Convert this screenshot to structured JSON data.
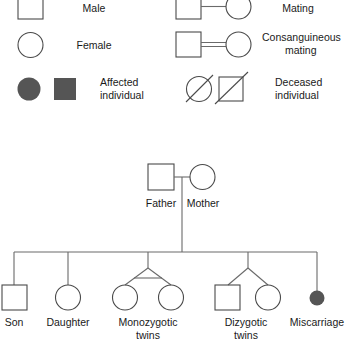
{
  "figure": {
    "kind": "pedigree-chart-legend-and-family-tree",
    "background_color": "#ffffff",
    "line_color": "#6a6a6a",
    "symbol_stroke_color": "#4a4a4a",
    "affected_fill_color": "#555555",
    "text_color": "#1a1a1a"
  },
  "legend": {
    "rows": [
      {
        "id": "male",
        "label": "Male",
        "symbols": [
          "square-unfilled"
        ]
      },
      {
        "id": "female",
        "label": "Female",
        "symbols": [
          "circle-unfilled"
        ]
      },
      {
        "id": "affected",
        "label_line1": "Affected",
        "label_line2": "individual",
        "symbols": [
          "circle-filled",
          "square-filled"
        ]
      },
      {
        "id": "mating",
        "label": "Mating",
        "symbols": [
          "square-unfilled",
          "circle-unfilled"
        ],
        "connector": "single-line"
      },
      {
        "id": "consanguineous",
        "label_line1": "Consanguineous",
        "label_line2": "mating",
        "symbols": [
          "square-unfilled",
          "circle-unfilled"
        ],
        "connector": "double-line"
      },
      {
        "id": "deceased",
        "label_line1": "Deceased",
        "label_line2": "individual",
        "symbols": [
          "circle-slashed",
          "square-slashed"
        ],
        "connector": "none"
      }
    ]
  },
  "pedigree": {
    "generation1": [
      {
        "id": "father",
        "label": "Father",
        "symbol": "square-unfilled"
      },
      {
        "id": "mother",
        "label": "Mother",
        "symbol": "circle-unfilled"
      }
    ],
    "generation2": [
      {
        "id": "son",
        "label": "Son",
        "symbol": "square-unfilled",
        "twin_type": "none"
      },
      {
        "id": "daughter",
        "label": "Daughter",
        "symbol": "circle-unfilled",
        "twin_type": "none"
      },
      {
        "id": "monozygotic-twins",
        "label_line1": "Monozygotic",
        "label_line2": "twins",
        "symbols": [
          "circle-unfilled",
          "circle-unfilled"
        ],
        "twin_type": "monozygotic"
      },
      {
        "id": "dizygotic-twins",
        "label_line1": "Dizygotic",
        "label_line2": "twins",
        "symbols": [
          "square-unfilled",
          "circle-unfilled"
        ],
        "twin_type": "dizygotic"
      },
      {
        "id": "miscarriage",
        "label": "Miscarriage",
        "symbol": "small-circle-filled",
        "twin_type": "none"
      }
    ]
  }
}
